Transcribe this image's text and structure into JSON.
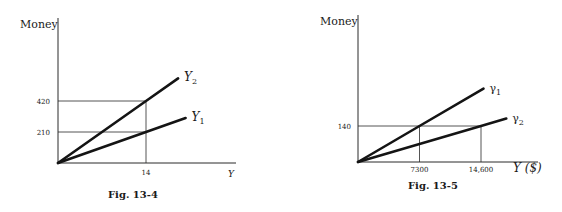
{
  "chart_data": [
    {
      "type": "line",
      "title": "",
      "caption": "Fig. 13-4",
      "ylabel": "Money",
      "xlabel": "Y",
      "xlim": [
        0,
        20
      ],
      "ylim": [
        0,
        700
      ],
      "grid": false,
      "yticks": [
        {
          "value": 210,
          "label": "210"
        },
        {
          "value": 420,
          "label": "420"
        }
      ],
      "xticks": [
        {
          "value": 14,
          "label": "14"
        }
      ],
      "series": [
        {
          "name": "Y₂",
          "base": "Y",
          "sub": "2",
          "points": [
            [
              0,
              0
            ],
            [
              14,
              420
            ],
            [
              19.1,
              573
            ]
          ]
        },
        {
          "name": "Y₁",
          "base": "Y",
          "sub": "1",
          "points": [
            [
              0,
              0
            ],
            [
              14,
              210
            ],
            [
              20.3,
              305
            ]
          ]
        }
      ],
      "guides": [
        {
          "from": [
            0,
            420
          ],
          "to": [
            14,
            420
          ]
        },
        {
          "from": [
            0,
            210
          ],
          "to": [
            14,
            210
          ]
        },
        {
          "from": [
            14,
            0
          ],
          "to": [
            14,
            420
          ]
        }
      ]
    },
    {
      "type": "line",
      "title": "",
      "caption": "Fig. 13-5",
      "ylabel": "Money",
      "xlabel": "Y ($)",
      "xlim": [
        0,
        19500
      ],
      "ylim": [
        0,
        415
      ],
      "grid": false,
      "yticks": [
        {
          "value": 140,
          "label": "140"
        }
      ],
      "xticks": [
        {
          "value": 7300,
          "label": "7300"
        },
        {
          "value": 14600,
          "label": "14,600"
        }
      ],
      "series": [
        {
          "name": "γ₁",
          "base": "γ",
          "sub": "1",
          "points": [
            [
              0,
              0
            ],
            [
              7300,
              140
            ],
            [
              14900,
              285
            ]
          ]
        },
        {
          "name": "γ₂",
          "base": "γ",
          "sub": "2",
          "points": [
            [
              0,
              0
            ],
            [
              14600,
              140
            ],
            [
              17600,
              169
            ]
          ]
        }
      ],
      "guides": [
        {
          "from": [
            0,
            140
          ],
          "to": [
            14600,
            140
          ]
        },
        {
          "from": [
            7300,
            0
          ],
          "to": [
            7300,
            140
          ]
        },
        {
          "from": [
            14600,
            0
          ],
          "to": [
            14600,
            140
          ]
        }
      ]
    }
  ]
}
